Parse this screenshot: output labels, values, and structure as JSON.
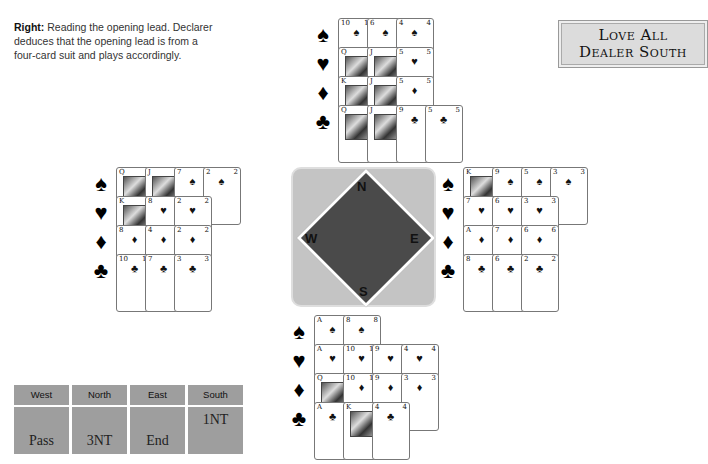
{
  "caption": {
    "lead": "Right:",
    "text": " Reading the opening lead. Declarer deduces that the opening lead is from a four-card suit and plays accordingly."
  },
  "vulnerability": {
    "line1": "Love All",
    "line2": "Dealer South"
  },
  "suits": [
    {
      "name": "spades",
      "symbol": "♠"
    },
    {
      "name": "hearts",
      "symbol": "♥"
    },
    {
      "name": "diamonds",
      "symbol": "♦"
    },
    {
      "name": "clubs",
      "symbol": "♣"
    }
  ],
  "hands": {
    "north": {
      "spades": [
        "10",
        "6",
        "4"
      ],
      "hearts": [
        "Q",
        "J",
        "5"
      ],
      "diamonds": [
        "K",
        "J",
        "5"
      ],
      "clubs": [
        "Q",
        "J",
        "9",
        "5"
      ]
    },
    "west": {
      "spades": [
        "Q",
        "J",
        "7",
        "2"
      ],
      "hearts": [
        "K",
        "8",
        "2"
      ],
      "diamonds": [
        "8",
        "4",
        "2"
      ],
      "clubs": [
        "10",
        "7",
        "3"
      ]
    },
    "east": {
      "spades": [
        "K",
        "9",
        "5",
        "3"
      ],
      "hearts": [
        "7",
        "6",
        "3"
      ],
      "diamonds": [
        "A",
        "7",
        "6"
      ],
      "clubs": [
        "8",
        "6",
        "2"
      ]
    },
    "south": {
      "spades": [
        "A",
        "8"
      ],
      "hearts": [
        "A",
        "10",
        "9",
        "4"
      ],
      "diamonds": [
        "Q",
        "10",
        "9",
        "3"
      ],
      "clubs": [
        "A",
        "K",
        "4"
      ]
    }
  },
  "compass": {
    "n": "N",
    "s": "S",
    "e": "E",
    "w": "W"
  },
  "auction": {
    "headers": [
      "West",
      "North",
      "East",
      "South"
    ],
    "bids": [
      {
        "west": "Pass",
        "north": "3NT",
        "east": "End",
        "south": "1NT"
      }
    ]
  }
}
